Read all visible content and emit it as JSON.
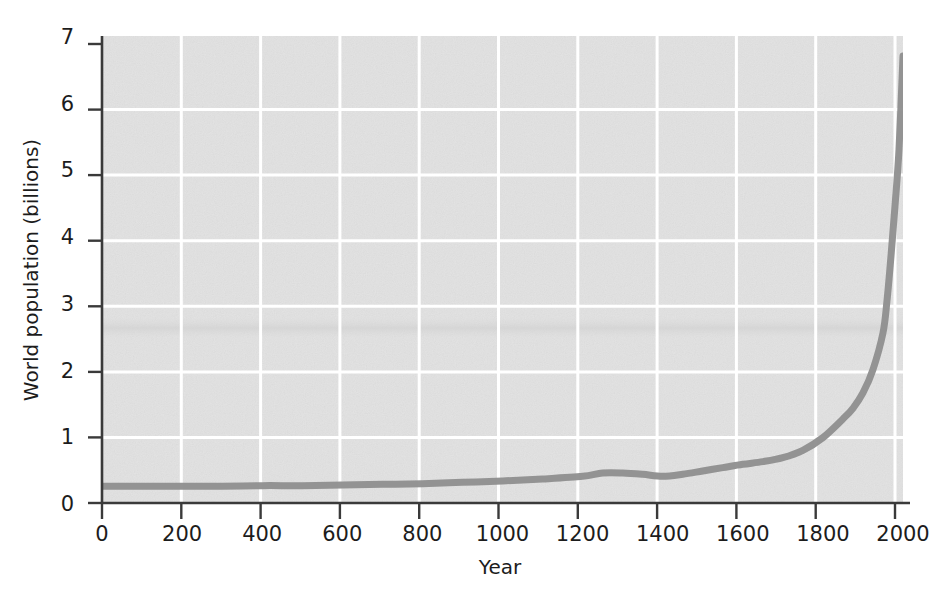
{
  "chart_data": {
    "type": "line",
    "title": "",
    "xlabel": "Year",
    "ylabel": "World population (billions)",
    "xlim": [
      0,
      2000
    ],
    "ylim": [
      0,
      7
    ],
    "xticks": [
      0,
      200,
      400,
      600,
      800,
      1000,
      1200,
      1400,
      1600,
      1800,
      2000
    ],
    "xtick_labels": [
      "0",
      "200",
      "400",
      "600",
      "800",
      "1000",
      "1200",
      "1400",
      "1600",
      "1800",
      "2000"
    ],
    "yticks": [
      0,
      1,
      2,
      3,
      4,
      5,
      6,
      7
    ],
    "ytick_labels": [
      "0",
      "1",
      "2",
      "3",
      "4",
      "5",
      "6",
      "7"
    ],
    "grid": true,
    "grid_color": "#ffffff",
    "plot_background": "#e2e2e2",
    "line_color": "#8e8e8e",
    "line_width": 7,
    "legend": null,
    "series": [
      {
        "name": "World population",
        "x": [
          0,
          100,
          200,
          300,
          400,
          500,
          600,
          700,
          800,
          900,
          1000,
          1100,
          1200,
          1250,
          1300,
          1350,
          1400,
          1450,
          1500,
          1550,
          1600,
          1650,
          1700,
          1750,
          1800,
          1850,
          1875,
          1900,
          1925,
          1950,
          1960,
          1970,
          1980,
          1990,
          2000
        ],
        "y": [
          0.25,
          0.25,
          0.25,
          0.25,
          0.26,
          0.26,
          0.27,
          0.28,
          0.29,
          0.31,
          0.33,
          0.36,
          0.4,
          0.45,
          0.45,
          0.43,
          0.4,
          0.43,
          0.48,
          0.53,
          0.58,
          0.62,
          0.68,
          0.79,
          0.98,
          1.26,
          1.42,
          1.65,
          2.0,
          2.55,
          3.03,
          3.7,
          4.45,
          5.3,
          6.7
        ]
      }
    ],
    "annotations": []
  },
  "axes": {
    "x_title": "Year",
    "y_title": "World population (billions)"
  }
}
